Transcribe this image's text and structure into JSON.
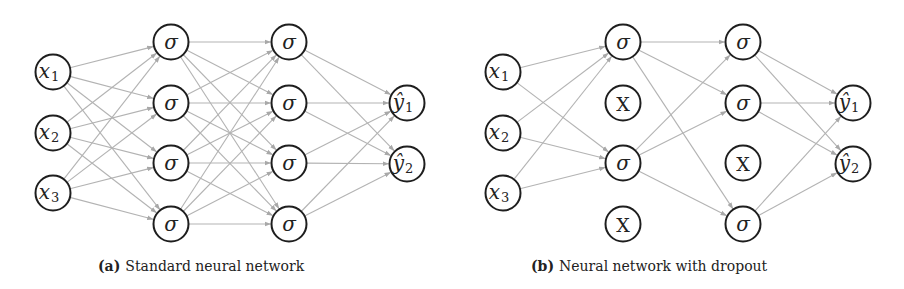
{
  "figure": {
    "colors": {
      "edge": "#b3b3b3",
      "node_stroke": "#1e1e1e",
      "node_fill": "#ffffff",
      "text": "#222222"
    },
    "node_radius": 17.5,
    "panels": [
      {
        "id": "a",
        "caption_tag": "(a)",
        "caption_text": "Standard neural network",
        "caption_x": 98,
        "layers": [
          {
            "name": "input",
            "x": 53,
            "nodes": [
              {
                "y": 72,
                "label": "x",
                "sub": "1",
                "type": "input"
              },
              {
                "y": 133,
                "label": "x",
                "sub": "2",
                "type": "input"
              },
              {
                "y": 193,
                "label": "x",
                "sub": "3",
                "type": "input"
              }
            ]
          },
          {
            "name": "hidden-1",
            "x": 171,
            "nodes": [
              {
                "y": 42,
                "label": "σ",
                "type": "active"
              },
              {
                "y": 103,
                "label": "σ",
                "type": "active"
              },
              {
                "y": 163,
                "label": "σ",
                "type": "active"
              },
              {
                "y": 224,
                "label": "σ",
                "type": "active"
              }
            ]
          },
          {
            "name": "hidden-2",
            "x": 289,
            "nodes": [
              {
                "y": 42,
                "label": "σ",
                "type": "active"
              },
              {
                "y": 103,
                "label": "σ",
                "type": "active"
              },
              {
                "y": 163,
                "label": "σ",
                "type": "active"
              },
              {
                "y": 224,
                "label": "σ",
                "type": "active"
              }
            ]
          },
          {
            "name": "output",
            "x": 407,
            "nodes": [
              {
                "y": 103,
                "label": "ŷ",
                "sub": "1",
                "type": "output"
              },
              {
                "y": 164,
                "label": "ŷ",
                "sub": "2",
                "type": "output"
              }
            ]
          }
        ],
        "edges": [
          [
            [
              0,
              0
            ],
            [
              1,
              0
            ]
          ],
          [
            [
              0,
              0
            ],
            [
              1,
              1
            ]
          ],
          [
            [
              0,
              0
            ],
            [
              1,
              2
            ]
          ],
          [
            [
              0,
              0
            ],
            [
              1,
              3
            ]
          ],
          [
            [
              0,
              1
            ],
            [
              1,
              0
            ]
          ],
          [
            [
              0,
              1
            ],
            [
              1,
              1
            ]
          ],
          [
            [
              0,
              1
            ],
            [
              1,
              2
            ]
          ],
          [
            [
              0,
              1
            ],
            [
              1,
              3
            ]
          ],
          [
            [
              0,
              2
            ],
            [
              1,
              0
            ]
          ],
          [
            [
              0,
              2
            ],
            [
              1,
              1
            ]
          ],
          [
            [
              0,
              2
            ],
            [
              1,
              2
            ]
          ],
          [
            [
              0,
              2
            ],
            [
              1,
              3
            ]
          ],
          [
            [
              1,
              0
            ],
            [
              2,
              0
            ]
          ],
          [
            [
              1,
              0
            ],
            [
              2,
              1
            ]
          ],
          [
            [
              1,
              0
            ],
            [
              2,
              2
            ]
          ],
          [
            [
              1,
              0
            ],
            [
              2,
              3
            ]
          ],
          [
            [
              1,
              1
            ],
            [
              2,
              0
            ]
          ],
          [
            [
              1,
              1
            ],
            [
              2,
              1
            ]
          ],
          [
            [
              1,
              1
            ],
            [
              2,
              2
            ]
          ],
          [
            [
              1,
              1
            ],
            [
              2,
              3
            ]
          ],
          [
            [
              1,
              2
            ],
            [
              2,
              0
            ]
          ],
          [
            [
              1,
              2
            ],
            [
              2,
              1
            ]
          ],
          [
            [
              1,
              2
            ],
            [
              2,
              2
            ]
          ],
          [
            [
              1,
              2
            ],
            [
              2,
              3
            ]
          ],
          [
            [
              1,
              3
            ],
            [
              2,
              0
            ]
          ],
          [
            [
              1,
              3
            ],
            [
              2,
              1
            ]
          ],
          [
            [
              1,
              3
            ],
            [
              2,
              2
            ]
          ],
          [
            [
              1,
              3
            ],
            [
              2,
              3
            ]
          ],
          [
            [
              2,
              0
            ],
            [
              3,
              0
            ]
          ],
          [
            [
              2,
              0
            ],
            [
              3,
              1
            ]
          ],
          [
            [
              2,
              1
            ],
            [
              3,
              0
            ]
          ],
          [
            [
              2,
              1
            ],
            [
              3,
              1
            ]
          ],
          [
            [
              2,
              2
            ],
            [
              3,
              0
            ]
          ],
          [
            [
              2,
              2
            ],
            [
              3,
              1
            ]
          ],
          [
            [
              2,
              3
            ],
            [
              3,
              0
            ]
          ],
          [
            [
              2,
              3
            ],
            [
              3,
              1
            ]
          ]
        ]
      },
      {
        "id": "b",
        "caption_tag": "(b)",
        "caption_text": "Neural network with dropout",
        "caption_x": 531,
        "layers": [
          {
            "name": "input",
            "x": 503,
            "nodes": [
              {
                "y": 72,
                "label": "x",
                "sub": "1",
                "type": "input"
              },
              {
                "y": 133,
                "label": "x",
                "sub": "2",
                "type": "input"
              },
              {
                "y": 193,
                "label": "x",
                "sub": "3",
                "type": "input"
              }
            ]
          },
          {
            "name": "hidden-1",
            "x": 623,
            "nodes": [
              {
                "y": 42,
                "label": "σ",
                "type": "active"
              },
              {
                "y": 103,
                "label": "X",
                "type": "dropped"
              },
              {
                "y": 163,
                "label": "σ",
                "type": "active"
              },
              {
                "y": 224,
                "label": "X",
                "type": "dropped"
              }
            ]
          },
          {
            "name": "hidden-2",
            "x": 743,
            "nodes": [
              {
                "y": 42,
                "label": "σ",
                "type": "active"
              },
              {
                "y": 103,
                "label": "σ",
                "type": "active"
              },
              {
                "y": 163,
                "label": "X",
                "type": "dropped"
              },
              {
                "y": 224,
                "label": "σ",
                "type": "active"
              }
            ]
          },
          {
            "name": "output",
            "x": 853,
            "nodes": [
              {
                "y": 103,
                "label": "ŷ",
                "sub": "1",
                "type": "output"
              },
              {
                "y": 164,
                "label": "ŷ",
                "sub": "2",
                "type": "output"
              }
            ]
          }
        ],
        "edges": [
          [
            [
              0,
              0
            ],
            [
              1,
              0
            ]
          ],
          [
            [
              0,
              0
            ],
            [
              1,
              2
            ]
          ],
          [
            [
              0,
              1
            ],
            [
              1,
              0
            ]
          ],
          [
            [
              0,
              1
            ],
            [
              1,
              2
            ]
          ],
          [
            [
              0,
              2
            ],
            [
              1,
              0
            ]
          ],
          [
            [
              0,
              2
            ],
            [
              1,
              2
            ]
          ],
          [
            [
              1,
              0
            ],
            [
              2,
              0
            ]
          ],
          [
            [
              1,
              0
            ],
            [
              2,
              1
            ]
          ],
          [
            [
              1,
              0
            ],
            [
              2,
              3
            ]
          ],
          [
            [
              1,
              2
            ],
            [
              2,
              0
            ]
          ],
          [
            [
              1,
              2
            ],
            [
              2,
              1
            ]
          ],
          [
            [
              1,
              2
            ],
            [
              2,
              3
            ]
          ],
          [
            [
              2,
              0
            ],
            [
              3,
              0
            ]
          ],
          [
            [
              2,
              0
            ],
            [
              3,
              1
            ]
          ],
          [
            [
              2,
              1
            ],
            [
              3,
              0
            ]
          ],
          [
            [
              2,
              1
            ],
            [
              3,
              1
            ]
          ],
          [
            [
              2,
              3
            ],
            [
              3,
              0
            ]
          ],
          [
            [
              2,
              3
            ],
            [
              3,
              1
            ]
          ]
        ]
      }
    ]
  }
}
